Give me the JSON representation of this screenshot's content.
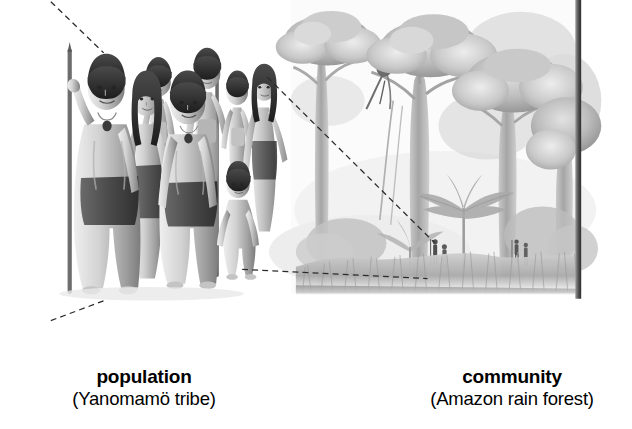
{
  "figure": {
    "style": "grayscale pencil illustration",
    "background_color": "#ffffff",
    "width": 632,
    "height": 429
  },
  "captions": [
    {
      "id": "population",
      "title": "population",
      "subtitle": "(Yanomamö tribe)"
    },
    {
      "id": "community",
      "title": "community",
      "subtitle": "(Amazon rain forest)"
    }
  ],
  "panels": {
    "left": {
      "name": "yanomamo-tribe-illustration",
      "description": "Group of Yanomamö tribe members standing, two men holding long spears, women and children behind, one toddler in front"
    },
    "right": {
      "name": "amazon-rain-forest-illustration",
      "description": "Tall rain forest canopy trees with vines, palm undergrowth, tall grass, and two pairs of tiny human figures at ground level"
    }
  },
  "connectors": [
    {
      "name": "dashed-line-top-left",
      "x1": 0,
      "y1": 2,
      "x2": 63,
      "y2": 63
    },
    {
      "name": "dashed-line-upper-link",
      "x1": 258,
      "y1": 92,
      "x2": 457,
      "y2": 289
    },
    {
      "name": "dashed-line-lower-link",
      "x1": 228,
      "y1": 321,
      "x2": 449,
      "y2": 332
    },
    {
      "name": "dashed-line-bottom-left",
      "x1": 0,
      "y1": 382,
      "x2": 67,
      "y2": 357
    }
  ],
  "colors": {
    "ink": "#000000",
    "dash": "#2b2b2b",
    "paper": "#ffffff",
    "pencil_light": "#d8d8d8",
    "pencil_mid": "#a8a8a8",
    "pencil_dark": "#6e6e6e",
    "edge_strip": "#3a3a3a"
  }
}
